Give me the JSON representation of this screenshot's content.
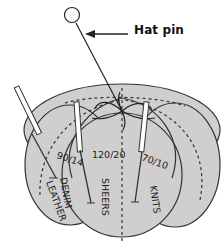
{
  "diagram": {
    "callout": {
      "label": "Hat pin",
      "arrow": "left-arrow"
    },
    "sections": [
      {
        "needle_size": "90/14",
        "fabric": "DENIM",
        "fabric_line2": "LEATHER"
      },
      {
        "needle_size": "120/20",
        "fabric": "SHEERS"
      },
      {
        "needle_size": "70/10",
        "fabric": "KNITS"
      }
    ],
    "colors": {
      "cushion_fill": "#cfcfcf",
      "outline": "#333333",
      "background": "#ffffff"
    }
  }
}
